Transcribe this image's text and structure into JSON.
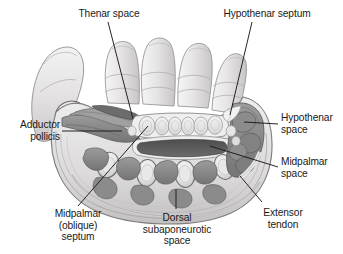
{
  "figure": {
    "background_color": "#ffffff",
    "line_color": "#1a1a1a",
    "text_color": "#1a1a1a"
  },
  "labels": [
    {
      "id": "thenar-space",
      "text": "Thenar space",
      "align": "center"
    },
    {
      "id": "hypothenar-septum",
      "text": "Hypothenar septum",
      "align": "center"
    },
    {
      "id": "adductor-pollicis",
      "text": "Adductor\npollicis",
      "align": "right"
    },
    {
      "id": "hypothenar-space",
      "text": "Hypothenar\nspace",
      "align": "left"
    },
    {
      "id": "midpalmar-space",
      "text": "Midpalmar\nspace",
      "align": "left"
    },
    {
      "id": "extensor-tendon",
      "text": "Extensor\ntendon",
      "align": "center"
    },
    {
      "id": "dorsal-subaponeurotic-space",
      "text": "Dorsal\nsubaponeurotic\nspace",
      "align": "center"
    },
    {
      "id": "midpalmar-oblique-septum",
      "text": "Midpalmar\n(oblique)\nseptum",
      "align": "center"
    }
  ],
  "palette": {
    "skin_light": "#eceaea",
    "skin_mid": "#d6d4d4",
    "skin_shadow": "#bcbaba",
    "fascia": "#f2f1f1",
    "muscle_dark": "#8d8d8d",
    "muscle_darker": "#767676",
    "space_dark": "#555555",
    "bone_light": "#ededed",
    "bone_rim": "#9a9a9a",
    "tendon": "#e4e3e3",
    "outline": "#555555"
  }
}
